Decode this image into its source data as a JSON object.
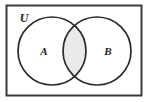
{
  "figure": {
    "kind": "venn-diagram",
    "universe_label": "U",
    "set_a_label": "A",
    "set_b_label": "B",
    "shaded_region": "A-intersect-B",
    "colors": {
      "background": "#ffffff",
      "stroke": "#2b2b2b",
      "rect_stroke": "#3a3a3a",
      "intersection_fill": "#eaeaea",
      "label_color": "#1c1c1c"
    },
    "geometry": {
      "rect": {
        "x": 6,
        "y": 5,
        "width": 136,
        "height": 91
      },
      "circle_a": {
        "cx": 52,
        "cy": 51,
        "r": 34
      },
      "circle_b": {
        "cx": 97,
        "cy": 51,
        "r": 34
      },
      "label_a_pos": {
        "x": 44,
        "y": 52
      },
      "label_b_pos": {
        "x": 108,
        "y": 52
      },
      "label_u_pos": {
        "x": 24,
        "y": 19
      }
    }
  }
}
